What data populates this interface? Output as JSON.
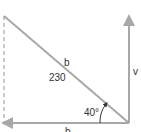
{
  "diagram": {
    "type": "right-triangle-vector",
    "labels": {
      "hypotenuse_name": "b",
      "hypotenuse_value": "230",
      "angle": "40°",
      "vertical": "v",
      "horizontal": "b"
    },
    "colors": {
      "line": "#a8a8a8",
      "text": "#333333",
      "background": "#ffffff"
    }
  }
}
